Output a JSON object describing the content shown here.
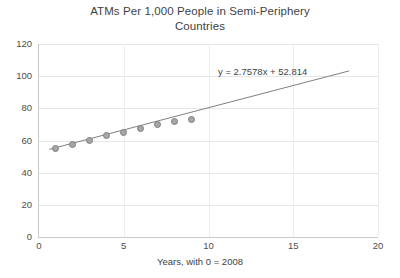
{
  "chart_data": {
    "type": "scatter",
    "title": "ATMs Per 1,000 People in Semi-Periphery Countries",
    "title_lines": [
      "ATMs Per 1,000 People in Semi-Periphery",
      "Countries"
    ],
    "xlabel": "Years, with 0 = 2008",
    "ylabel": "",
    "xlim": [
      0,
      20
    ],
    "ylim": [
      0,
      120
    ],
    "xticks": [
      0,
      5,
      10,
      15,
      20
    ],
    "yticks": [
      0,
      20,
      40,
      60,
      80,
      100,
      120
    ],
    "grid": true,
    "legend": "none",
    "x": [
      1,
      2,
      3,
      4,
      5,
      6,
      7,
      8,
      9
    ],
    "values": [
      55,
      57.5,
      60,
      63,
      65,
      67.5,
      70,
      72,
      73
    ],
    "series": [
      {
        "name": "ATMs per 1,000 people",
        "x": [
          1,
          2,
          3,
          4,
          5,
          6,
          7,
          8,
          9
        ],
        "values": [
          55,
          57.5,
          60,
          63,
          65,
          67.5,
          70,
          72,
          73
        ],
        "marker_color": "#a6a6a6",
        "marker_edge_color": "#7f7f7f"
      }
    ],
    "trendline": {
      "equation": "y = 2.7578x + 52.814",
      "slope": 2.7578,
      "intercept": 52.814,
      "x_start": 0.6,
      "x_end": 18.3,
      "color": "#808080"
    },
    "annotations": [
      {
        "text": "y = 2.7578x + 52.814",
        "x": 10.1,
        "y": 106
      }
    ],
    "colors": {
      "gridline": "#e6e6e6",
      "axis": "#c8c8c8",
      "text": "#3f3f3f",
      "tick_text": "#4d4d4d",
      "background": "#ffffff"
    }
  }
}
